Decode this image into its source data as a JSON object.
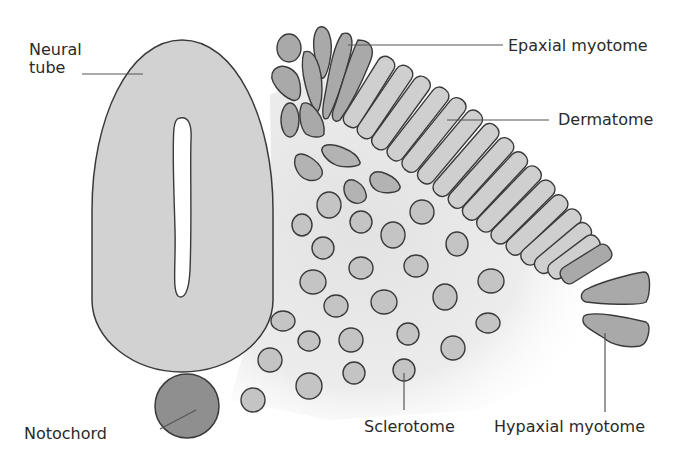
{
  "diagram": {
    "type": "anatomy-cross-section",
    "colors": {
      "outline": "#3a3a3a",
      "neural_tube_fill": "#d2d2d2",
      "dermatome_fill": "#cfcfcf",
      "myotome_fill": "#a9a9a9",
      "sclerotome_cell_fill": "#c4c4c4",
      "notochord_fill": "#8f8f8f",
      "mesenchyme_shade": "#e6e6e6",
      "leader_line": "#555555",
      "text": "#2a2a2a"
    },
    "labels": {
      "neural_tube": "Neural\ntube",
      "epaxial_myotome": "Epaxial myotome",
      "dermatome": "Dermatome",
      "notochord": "Notochord",
      "sclerotome": "Sclerotome",
      "hypaxial_myotome": "Hypaxial myotome"
    }
  }
}
